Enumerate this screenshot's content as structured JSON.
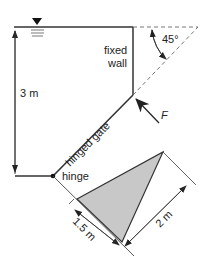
{
  "diagram": {
    "labels": {
      "depth": "3 m",
      "fixed_wall_line1": "fixed",
      "fixed_wall_line2": "wall",
      "angle": "45°",
      "force": "F",
      "gate": "hinged gate",
      "hinge": "hinge",
      "base": "1.5 m",
      "height": "2 m"
    },
    "colors": {
      "line": "#333333",
      "dashed": "#666666",
      "triangle_fill": "#c8c8c8"
    },
    "symbols": {
      "water_surface": "inverted-triangle-icon"
    }
  }
}
